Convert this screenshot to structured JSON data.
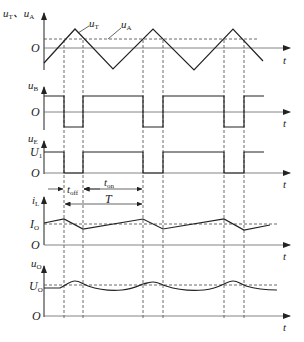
{
  "diagram": {
    "panels": [
      {
        "id": "uT_uA",
        "axis_label_main": "u",
        "axis_label_sub1": "T",
        "sep": "、",
        "axis_label_main2": "u",
        "axis_label_sub2": "A",
        "origin_label": "O",
        "time_label": "t",
        "curves": [
          {
            "name": "u_T",
            "label_main": "u",
            "label_sub": "T",
            "type": "triangle"
          },
          {
            "name": "u_A",
            "label_main": "u",
            "label_sub": "A",
            "type": "dashed-threshold"
          }
        ]
      },
      {
        "id": "uB",
        "axis_label_main": "u",
        "axis_label_sub": "B",
        "origin_label": "O",
        "time_label": "t",
        "type": "square"
      },
      {
        "id": "uE",
        "axis_label_main": "u",
        "axis_label_sub": "E",
        "level_label_main": "U",
        "level_label_sub": "1",
        "origin_label": "O",
        "time_label": "t",
        "type": "square"
      },
      {
        "id": "iL",
        "axis_label_main": "i",
        "axis_label_sub": "L",
        "level_label_main": "I",
        "level_label_sub": "O",
        "origin_label": "O",
        "time_label": "t",
        "type": "sawtooth"
      },
      {
        "id": "uO",
        "axis_label_main": "u",
        "axis_label_sub": "O",
        "level_label_main": "U",
        "level_label_sub": "O",
        "origin_label": "O",
        "time_label": "t",
        "type": "ripple"
      }
    ],
    "intervals": {
      "t_off": {
        "main": "t",
        "sub": "off"
      },
      "t_on": {
        "main": "t",
        "sub": "on"
      },
      "period": {
        "main": "T"
      }
    },
    "switch_times_px": [
      64,
      83,
      143,
      163,
      224,
      244
    ],
    "colors": {
      "line": "#222222",
      "axis": "#555555",
      "dashed": "#444444"
    }
  }
}
